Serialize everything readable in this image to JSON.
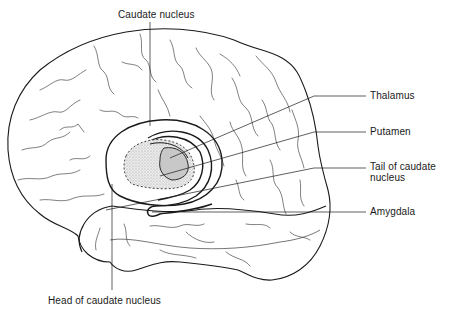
{
  "diagram": {
    "type": "anatomical-illustration",
    "colors": {
      "line": "#1a1a1a",
      "stipple_fill": "#d8d8d8",
      "background": "#ffffff"
    },
    "labels": [
      {
        "id": "caudate-nucleus",
        "text": "Caudate nucleus",
        "x": 118,
        "y": 14
      },
      {
        "id": "thalamus",
        "text": "Thalamus",
        "x": 370,
        "y": 92
      },
      {
        "id": "putamen",
        "text": "Putamen",
        "x": 370,
        "y": 129
      },
      {
        "id": "tail-of-caudate-nucleus",
        "text": "Tail of caudate\nnucleus",
        "x": 370,
        "y": 161
      },
      {
        "id": "amygdala",
        "text": "Amygdala",
        "x": 370,
        "y": 207
      },
      {
        "id": "head-of-caudate-nucleus",
        "text": "Head of caudate nucleus",
        "x": 48,
        "y": 300
      }
    ]
  }
}
